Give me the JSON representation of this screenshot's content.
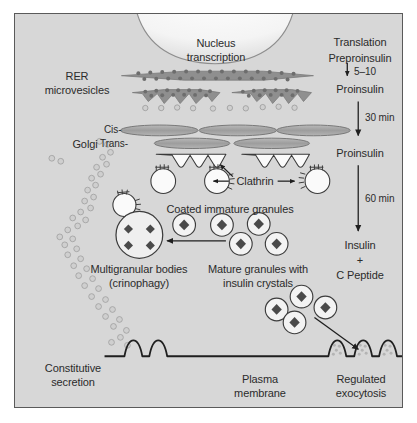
{
  "figure": {
    "background_color": "#d7d7d7",
    "frame_color": "#5a5a5a",
    "text_color": "#2b2b2b",
    "organelle_fill": "#a9a9a9",
    "organelle_stroke": "#6e6e6e",
    "vesicle_fill": "#f2f2f2",
    "crystal_fill": "#4a4a4a",
    "dot_fill": "#bdbdbd",
    "line_color": "#1f1f1f"
  },
  "labels": {
    "nucleus": "Nucleus",
    "transcription": "transcription",
    "rer": "RER",
    "microvesicles": "microvesicles",
    "golgi": "Golgi",
    "cis": "Cis-",
    "trans": "Trans-",
    "clathrin": "Clathrin",
    "coated_immature_granules": "Coated immature granules",
    "multigranular_bodies": "Multigranular bodies",
    "crinophagy": "(crinophagy)",
    "mature_granules_line1": "Mature granules with",
    "mature_granules_line2": "insulin crystals",
    "constitutive_line1": "Constitutive",
    "constitutive_line2": "secretion",
    "plasma_membrane_line1": "Plasma",
    "plasma_membrane_line2": "membrane",
    "regulated_exocytosis_line1": "Regulated",
    "regulated_exocytosis_line2": "exocytosis"
  },
  "pathway": {
    "steps": [
      {
        "id": "translation",
        "text": "Translation"
      },
      {
        "id": "preproinsulin",
        "text": "Preproinsulin"
      },
      {
        "id": "proinsulin-1",
        "text": "Proinsulin"
      },
      {
        "id": "proinsulin-2",
        "text": "Proinsulin"
      },
      {
        "id": "insulin",
        "text": "Insulin"
      },
      {
        "id": "plus",
        "text": "+"
      },
      {
        "id": "c-peptide",
        "text": "C Peptide"
      }
    ],
    "timings": [
      {
        "id": "timing-5-10",
        "text": "5–10"
      },
      {
        "id": "timing-30",
        "text": "30 min"
      },
      {
        "id": "timing-60",
        "text": "60 min"
      }
    ]
  }
}
